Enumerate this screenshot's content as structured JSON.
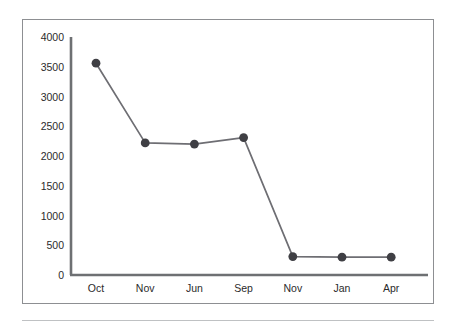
{
  "chart_data": {
    "type": "line",
    "title": "",
    "subtitle": "",
    "xlabel": "",
    "ylabel": "",
    "categories": [
      "Oct",
      "Nov",
      "Jun",
      "Sep",
      "Nov",
      "Jan",
      "Apr"
    ],
    "values": [
      3560,
      2220,
      2200,
      2310,
      310,
      300,
      300
    ],
    "series": [
      {
        "name": "",
        "values": [
          3560,
          2220,
          2200,
          2310,
          310,
          300,
          300
        ]
      }
    ],
    "ylim": [
      0,
      4000
    ],
    "ytick_labels": [
      "4000",
      "3500",
      "3000",
      "2500",
      "2000",
      "1500",
      "1000",
      "500",
      "0"
    ],
    "ytick_values": [
      4000,
      3500,
      3000,
      2500,
      2000,
      1500,
      1000,
      500,
      0
    ],
    "xtick_labels": [
      "Oct",
      "Nov",
      "Jun",
      "Sep",
      "Nov",
      "Jan",
      "Apr"
    ],
    "grid": false,
    "legend": false,
    "legend_position": "none",
    "marker": "circle",
    "colors": {
      "line": "#6e6e73",
      "marker": "#3f3f44",
      "axis": "#6e7073",
      "tick_text": "#2b2b2b",
      "frame_border": "#8d8f92",
      "rule": "#bfc1c3",
      "background": "#ffffff"
    }
  }
}
